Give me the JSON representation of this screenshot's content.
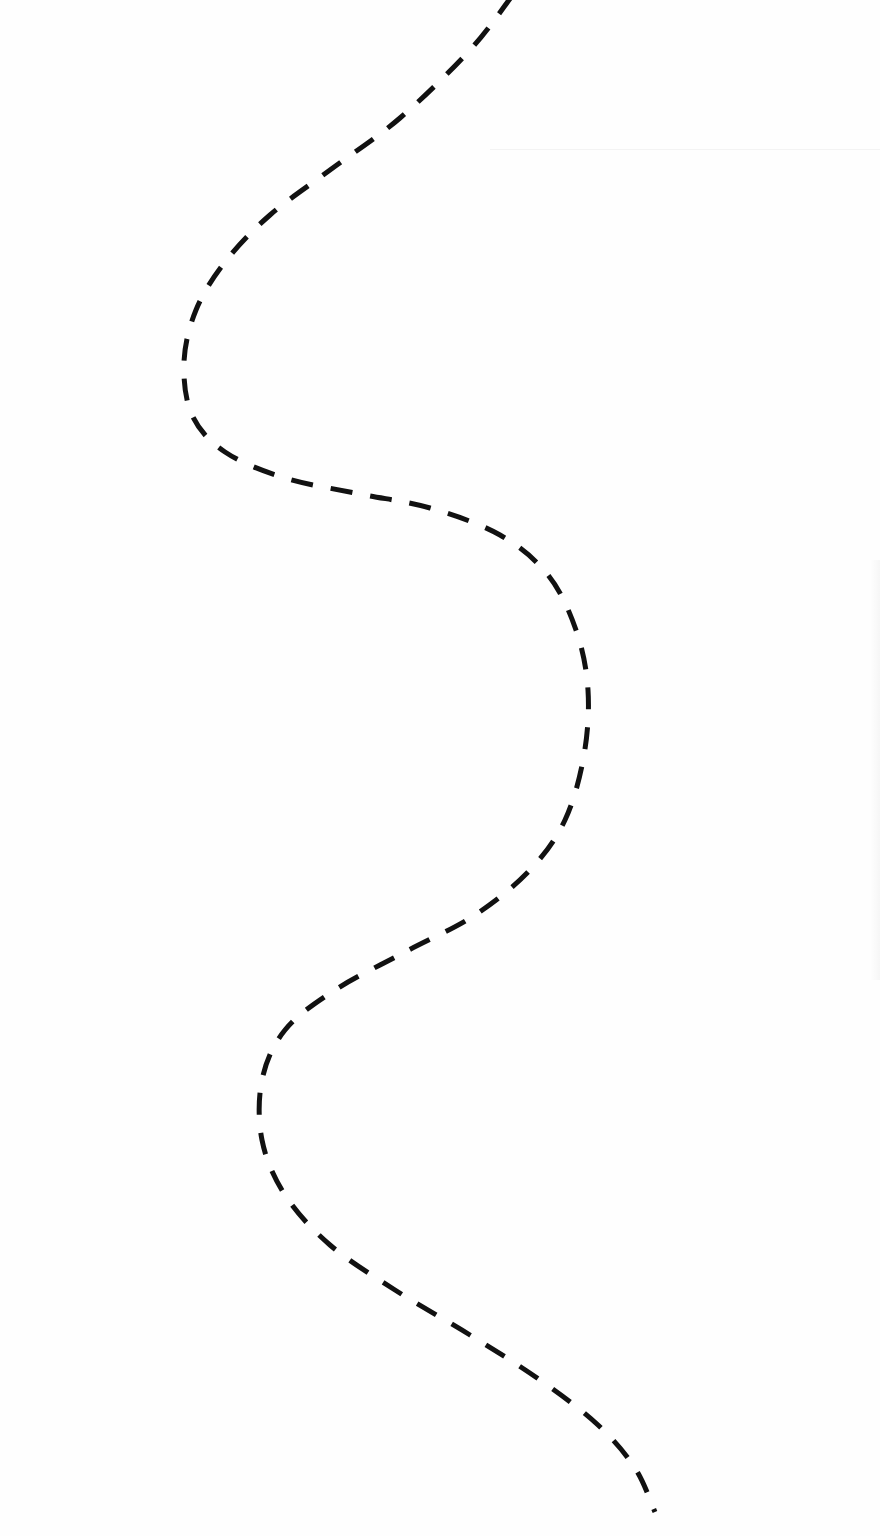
{
  "canvas": {
    "width": 880,
    "height": 1536,
    "background": "#fefefe"
  },
  "path": {
    "label": "dashed-wavy-path",
    "stroke": "#111111",
    "stroke_width": 5,
    "dash_pattern": "22 18",
    "points": [
      [
        512,
        -4
      ],
      [
        470,
        50
      ],
      [
        400,
        118
      ],
      [
        330,
        170
      ],
      [
        270,
        215
      ],
      [
        225,
        262
      ],
      [
        196,
        310
      ],
      [
        184,
        362
      ],
      [
        192,
        415
      ],
      [
        225,
        452
      ],
      [
        285,
        478
      ],
      [
        360,
        494
      ],
      [
        430,
        508
      ],
      [
        500,
        535
      ],
      [
        548,
        575
      ],
      [
        576,
        630
      ],
      [
        588,
        690
      ],
      [
        584,
        755
      ],
      [
        565,
        820
      ],
      [
        530,
        870
      ],
      [
        475,
        915
      ],
      [
        405,
        952
      ],
      [
        335,
        990
      ],
      [
        285,
        1030
      ],
      [
        262,
        1080
      ],
      [
        262,
        1140
      ],
      [
        285,
        1195
      ],
      [
        330,
        1245
      ],
      [
        395,
        1290
      ],
      [
        470,
        1335
      ],
      [
        540,
        1380
      ],
      [
        598,
        1425
      ],
      [
        635,
        1468
      ],
      [
        655,
        1512
      ]
    ]
  }
}
